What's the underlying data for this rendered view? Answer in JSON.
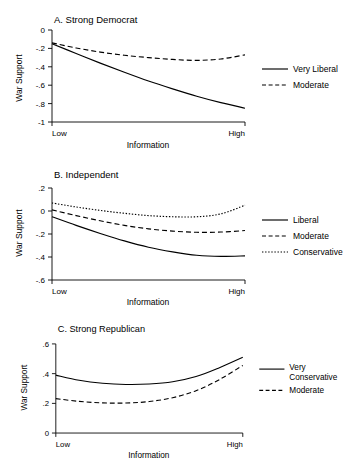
{
  "figure": {
    "panel_count": 3,
    "shared_xlabel": "Information",
    "shared_ylabel": "War Support",
    "x_tick_low": "Low",
    "x_tick_high": "High"
  },
  "chart_data": [
    {
      "type": "line",
      "title": "A. Strong Democrat",
      "xlabel": "Information",
      "ylabel": "War Support",
      "x": [
        0,
        0.125,
        0.25,
        0.375,
        0.5,
        0.625,
        0.75,
        0.875,
        1
      ],
      "xticklabels": [
        "Low",
        "High"
      ],
      "xlim": [
        0,
        1
      ],
      "ylim": [
        -1,
        0
      ],
      "yticks": [
        0,
        -0.2,
        -0.4,
        -0.6,
        -0.8,
        -1
      ],
      "yticklabels": [
        "0",
        "-.2",
        "-.4",
        "-.6",
        "-.8",
        "-1"
      ],
      "grid": false,
      "legend_position": "right",
      "series": [
        {
          "name": "Very Liberal",
          "style": "solid",
          "values": [
            -0.15,
            -0.255,
            -0.36,
            -0.46,
            -0.555,
            -0.64,
            -0.72,
            -0.79,
            -0.85
          ]
        },
        {
          "name": "Moderate",
          "style": "dashed",
          "values": [
            -0.14,
            -0.195,
            -0.24,
            -0.275,
            -0.3,
            -0.32,
            -0.33,
            -0.315,
            -0.27
          ]
        }
      ]
    },
    {
      "type": "line",
      "title": "B. Independent",
      "xlabel": "Information",
      "ylabel": "War Support",
      "x": [
        0,
        0.125,
        0.25,
        0.375,
        0.5,
        0.625,
        0.75,
        0.875,
        1
      ],
      "xticklabels": [
        "Low",
        "High"
      ],
      "xlim": [
        0,
        1
      ],
      "ylim": [
        -0.6,
        0.2
      ],
      "yticks": [
        0.2,
        0,
        -0.2,
        -0.4,
        -0.6
      ],
      "yticklabels": [
        ".2",
        "0",
        "-.2",
        "-.4",
        "-.6"
      ],
      "grid": false,
      "legend_position": "right",
      "series": [
        {
          "name": "Liberal",
          "style": "solid",
          "values": [
            -0.05,
            -0.125,
            -0.195,
            -0.26,
            -0.315,
            -0.355,
            -0.385,
            -0.395,
            -0.39
          ]
        },
        {
          "name": "Moderate",
          "style": "dashed",
          "values": [
            0.01,
            -0.04,
            -0.085,
            -0.125,
            -0.155,
            -0.175,
            -0.185,
            -0.183,
            -0.17
          ]
        },
        {
          "name": "Conservative",
          "style": "dotted",
          "values": [
            0.07,
            0.035,
            0.005,
            -0.02,
            -0.04,
            -0.05,
            -0.05,
            -0.025,
            0.05
          ]
        }
      ]
    },
    {
      "type": "line",
      "title": "C. Strong Republican",
      "xlabel": "Information",
      "ylabel": "War Support",
      "x": [
        0,
        0.125,
        0.25,
        0.375,
        0.5,
        0.625,
        0.75,
        0.875,
        1
      ],
      "xticklabels": [
        "Low",
        "High"
      ],
      "xlim": [
        0,
        1
      ],
      "ylim": [
        0,
        0.6
      ],
      "yticks": [
        0.6,
        0.4,
        0.2,
        0
      ],
      "yticklabels": [
        ".6",
        ".4",
        ".2",
        "0"
      ],
      "grid": false,
      "legend_position": "right",
      "series": [
        {
          "name": "Very Conservative",
          "style": "solid",
          "values": [
            0.39,
            0.355,
            0.335,
            0.327,
            0.33,
            0.345,
            0.38,
            0.44,
            0.51
          ]
        },
        {
          "name": "Moderate",
          "style": "dashed",
          "values": [
            0.232,
            0.213,
            0.203,
            0.202,
            0.212,
            0.238,
            0.285,
            0.36,
            0.455
          ]
        }
      ]
    }
  ],
  "panels": {
    "a": {
      "title": "A. Strong Democrat",
      "ylabel": "War Support",
      "xlabel": "Information",
      "xlow": "Low",
      "xhigh": "High",
      "yticks": [
        "0",
        "-.2",
        "-.4",
        "-.6",
        "-.8",
        "-1"
      ],
      "legend": [
        "Very Liberal",
        "Moderate"
      ]
    },
    "b": {
      "title": "B. Independent",
      "ylabel": "War Support",
      "xlabel": "Information",
      "xlow": "Low",
      "xhigh": "High",
      "yticks": [
        ".2",
        "0",
        "-.2",
        "-.4",
        "-.6"
      ],
      "legend": [
        "Liberal",
        "Moderate",
        "Conservative"
      ]
    },
    "c": {
      "title": "C. Strong Republican",
      "ylabel": "War Support",
      "xlabel": "Information",
      "xlow": "Low",
      "xhigh": "High",
      "yticks": [
        ".6",
        ".4",
        ".2",
        "0"
      ],
      "legend_line1": "Very",
      "legend_line2": "Conservative",
      "legend_moderate": "Moderate"
    }
  }
}
